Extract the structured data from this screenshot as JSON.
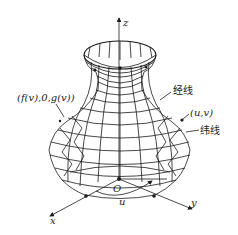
{
  "figure": {
    "axes": {
      "x_label": "x",
      "y_label": "y",
      "z_label": "z",
      "origin_label": "O",
      "angle_label": "u"
    },
    "annotations": {
      "profile_point": "(f(v),0,g(v))",
      "meridian": "经线",
      "surface_point": "(u,v)",
      "parallel": "纬线"
    },
    "colors": {
      "line": "#1a1a1a",
      "background": "#ffffff"
    }
  }
}
